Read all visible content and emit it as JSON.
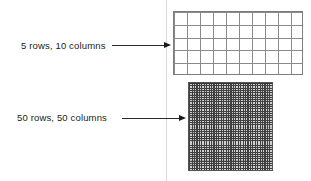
{
  "figure": {
    "background_color": "#ffffff",
    "ink_color": "#1c1c1c",
    "divider_color": "#d8d8d8",
    "annotations": [
      {
        "id": "top",
        "label": "5 rows, 10 columns",
        "rows": 5,
        "columns": 10,
        "arrow_direction": "right"
      },
      {
        "id": "bottom",
        "label": "50 rows, 50 columns",
        "rows": 50,
        "columns": 50,
        "arrow_direction": "right"
      }
    ]
  },
  "grids": {
    "coarse": {
      "rows": 5,
      "columns": 10,
      "line_color": "#8a8a8a",
      "fill_color": "#ffffff"
    },
    "dense": {
      "rows": 50,
      "columns": 50,
      "line_color": "#404040",
      "fill_color": "#cfcfcf"
    }
  }
}
